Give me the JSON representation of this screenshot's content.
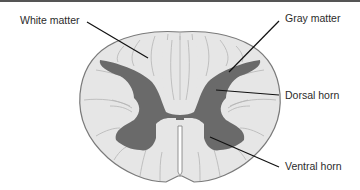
{
  "figure": {
    "labels": [
      {
        "id": "white-matter",
        "text": "White matter"
      },
      {
        "id": "gray-matter",
        "text": "Gray matter"
      },
      {
        "id": "dorsal-horn",
        "text": "Dorsal horn"
      },
      {
        "id": "ventral-horn",
        "text": "Ventral horn"
      }
    ],
    "colors": {
      "white_matter": "#e6e6e6",
      "gray_matter": "#6a6a6a",
      "outline": "#7a7a7a",
      "leader_line": "#111111",
      "text": "#2b2b2b"
    }
  }
}
